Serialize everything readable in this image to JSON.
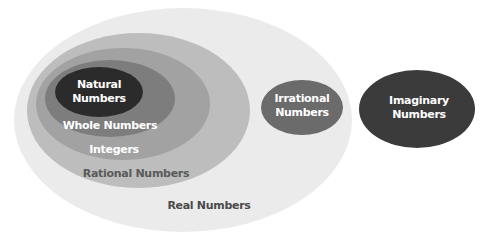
{
  "diagram": {
    "type": "nested-euler",
    "sets": [
      {
        "id": "real",
        "label": "Real Numbers",
        "color": "#ebebeb"
      },
      {
        "id": "rational",
        "label": "Rational Numbers",
        "color": "#bdbdbd"
      },
      {
        "id": "integers",
        "label": "Integers",
        "color": "#a2a2a2"
      },
      {
        "id": "whole",
        "label": "Whole Numbers",
        "color": "#7d7d7d"
      },
      {
        "id": "natural",
        "label_line1": "Natural",
        "label_line2": "Numbers",
        "color": "#2b2b2b"
      },
      {
        "id": "irrational",
        "label_line1": "Irrational",
        "label_line2": "Numbers",
        "color": "#6b6b6b"
      },
      {
        "id": "imaginary",
        "label_line1": "Imaginary",
        "label_line2": "Numbers",
        "color": "#3b3b3b"
      }
    ]
  }
}
